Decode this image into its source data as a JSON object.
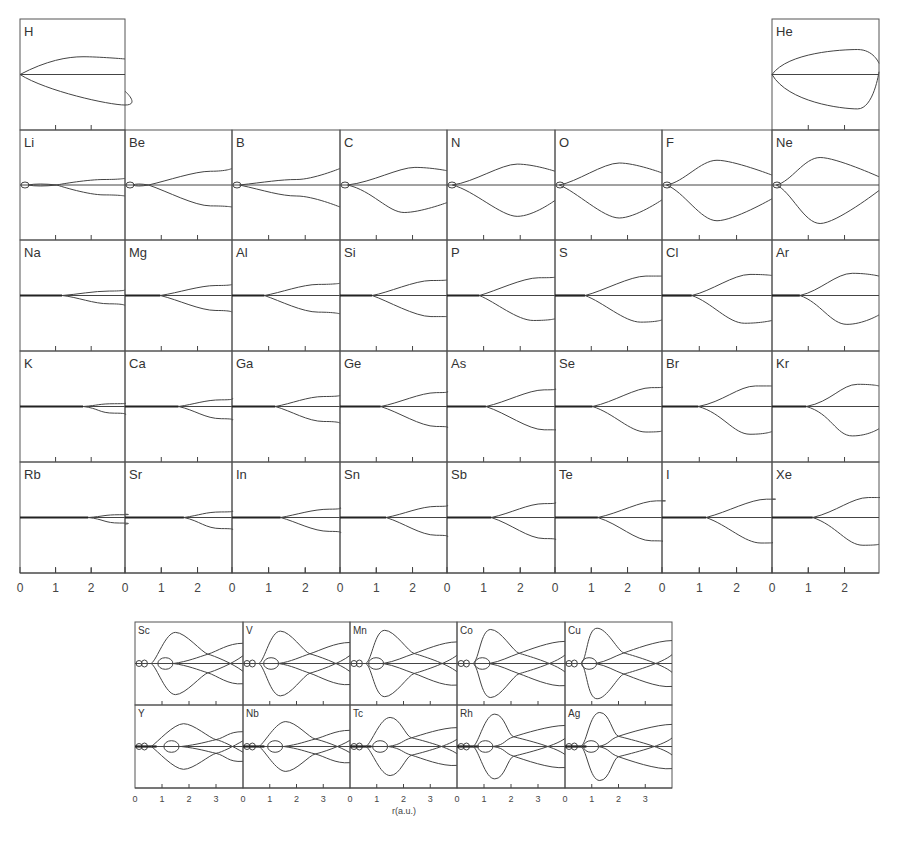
{
  "figure": {
    "x_axis_label": "r(a.u.)",
    "main_ticks": [
      "0",
      "1",
      "2"
    ],
    "tm_ticks": [
      "0",
      "1",
      "2",
      "3"
    ]
  },
  "chart_data": [
    {
      "type": "line",
      "title": "Main-group elements: radial curves vs r",
      "xlabel": "r (a.u.)",
      "xlim": [
        0,
        3
      ],
      "x_ticks": [
        0,
        1,
        2
      ],
      "panels": [
        {
          "el": "H",
          "row": 0,
          "col": 0,
          "branch": 0.0,
          "up": [
            0.25,
            -0.25,
            0.6,
            -0.32,
            1.0,
            -0.28
          ],
          "dn": [
            0.25,
            0.3,
            1.0,
            0.55,
            1.0,
            0.3
          ],
          "core": 0
        },
        {
          "el": "He",
          "row": 0,
          "col": 7,
          "branch": 0.0,
          "up": [
            0.15,
            -0.4,
            0.8,
            -0.45,
            1.0,
            -0.2
          ],
          "dn": [
            0.15,
            0.5,
            0.8,
            0.62,
            1.0,
            -0.05
          ],
          "core": 0
        },
        {
          "el": "Li",
          "row": 1,
          "col": 0,
          "branch": 0.35,
          "up": [
            0.4,
            -0.02,
            0.8,
            -0.1,
            1.0,
            -0.12
          ],
          "dn": [
            0.4,
            0.03,
            0.8,
            0.18,
            1.0,
            0.2
          ],
          "core": 1
        },
        {
          "el": "Be",
          "row": 1,
          "col": 1,
          "branch": 0.22,
          "up": [
            0.4,
            -0.08,
            0.8,
            -0.25,
            1.0,
            -0.3
          ],
          "dn": [
            0.4,
            0.12,
            0.8,
            0.38,
            1.0,
            0.4
          ],
          "core": 1
        },
        {
          "el": "B",
          "row": 1,
          "col": 2,
          "branch": 0.07,
          "up": [
            0.3,
            -0.05,
            0.6,
            -0.1,
            1.0,
            -0.3
          ],
          "dn": [
            0.3,
            0.1,
            0.6,
            0.2,
            1.0,
            0.4
          ],
          "core": 1
        },
        {
          "el": "C",
          "row": 1,
          "col": 3,
          "branch": 0.07,
          "up": [
            0.3,
            -0.05,
            0.7,
            -0.32,
            1.0,
            -0.26
          ],
          "dn": [
            0.3,
            0.1,
            0.6,
            0.5,
            1.0,
            0.32
          ],
          "core": 1
        },
        {
          "el": "N",
          "row": 1,
          "col": 4,
          "branch": 0.05,
          "up": [
            0.25,
            -0.05,
            0.65,
            -0.38,
            1.0,
            -0.25
          ],
          "dn": [
            0.25,
            0.1,
            0.65,
            0.57,
            1.0,
            0.28
          ],
          "core": 1
        },
        {
          "el": "O",
          "row": 1,
          "col": 5,
          "branch": 0.04,
          "up": [
            0.2,
            -0.05,
            0.6,
            -0.4,
            1.0,
            -0.22
          ],
          "dn": [
            0.2,
            0.12,
            0.6,
            0.6,
            1.0,
            0.27
          ],
          "core": 1
        },
        {
          "el": "F",
          "row": 1,
          "col": 6,
          "branch": 0.04,
          "up": [
            0.2,
            -0.05,
            0.5,
            -0.45,
            1.0,
            -0.18
          ],
          "dn": [
            0.2,
            0.12,
            0.5,
            0.65,
            1.0,
            0.25
          ],
          "core": 1
        },
        {
          "el": "Ne",
          "row": 1,
          "col": 7,
          "branch": 0.04,
          "up": [
            0.18,
            -0.06,
            0.45,
            -0.5,
            1.0,
            -0.15
          ],
          "dn": [
            0.18,
            0.12,
            0.45,
            0.7,
            1.0,
            0.1
          ],
          "core": 1
        },
        {
          "el": "Na",
          "row": 2,
          "col": 0,
          "branch": 0.4,
          "up": [
            0.55,
            -0.02,
            0.85,
            -0.08,
            1.0,
            -0.1
          ],
          "dn": [
            0.55,
            0.03,
            0.85,
            0.15,
            1.0,
            0.18
          ],
          "core": 2
        },
        {
          "el": "Mg",
          "row": 2,
          "col": 1,
          "branch": 0.33,
          "up": [
            0.5,
            -0.05,
            0.85,
            -0.18,
            1.0,
            -0.2
          ],
          "dn": [
            0.5,
            0.08,
            0.85,
            0.27,
            1.0,
            0.3
          ],
          "core": 2
        },
        {
          "el": "Al",
          "row": 2,
          "col": 2,
          "branch": 0.3,
          "up": [
            0.45,
            -0.05,
            0.8,
            -0.2,
            1.0,
            -0.22
          ],
          "dn": [
            0.45,
            0.1,
            0.8,
            0.3,
            1.0,
            0.33
          ],
          "core": 2
        },
        {
          "el": "Si",
          "row": 2,
          "col": 3,
          "branch": 0.3,
          "up": [
            0.45,
            -0.05,
            0.85,
            -0.27,
            1.0,
            -0.28
          ],
          "dn": [
            0.45,
            0.1,
            0.85,
            0.38,
            1.0,
            0.38
          ],
          "core": 2
        },
        {
          "el": "P",
          "row": 2,
          "col": 4,
          "branch": 0.3,
          "up": [
            0.45,
            -0.08,
            0.85,
            -0.32,
            1.0,
            -0.33
          ],
          "dn": [
            0.45,
            0.12,
            0.8,
            0.45,
            1.0,
            0.42
          ],
          "core": 2
        },
        {
          "el": "S",
          "row": 2,
          "col": 5,
          "branch": 0.28,
          "up": [
            0.45,
            -0.08,
            0.85,
            -0.35,
            1.0,
            -0.35
          ],
          "dn": [
            0.45,
            0.12,
            0.8,
            0.48,
            1.0,
            0.44
          ],
          "core": 2
        },
        {
          "el": "Cl",
          "row": 2,
          "col": 6,
          "branch": 0.27,
          "up": [
            0.45,
            -0.08,
            0.8,
            -0.38,
            1.0,
            -0.36
          ],
          "dn": [
            0.45,
            0.12,
            0.75,
            0.5,
            1.0,
            0.45
          ],
          "core": 2
        },
        {
          "el": "Ar",
          "row": 2,
          "col": 7,
          "branch": 0.26,
          "up": [
            0.45,
            -0.08,
            0.75,
            -0.4,
            1.0,
            -0.35
          ],
          "dn": [
            0.45,
            0.12,
            0.7,
            0.52,
            1.0,
            0.35
          ],
          "core": 2
        },
        {
          "el": "K",
          "row": 3,
          "col": 0,
          "branch": 0.6,
          "up": [
            0.75,
            -0.02,
            0.9,
            -0.05,
            1.0,
            -0.06
          ],
          "dn": [
            0.75,
            0.03,
            0.9,
            0.12,
            1.0,
            0.15
          ],
          "core": 3
        },
        {
          "el": "Ca",
          "row": 3,
          "col": 1,
          "branch": 0.5,
          "up": [
            0.65,
            -0.04,
            0.9,
            -0.12,
            1.0,
            -0.15
          ],
          "dn": [
            0.65,
            0.06,
            0.9,
            0.22,
            1.0,
            0.25
          ],
          "core": 3
        },
        {
          "el": "Ga",
          "row": 3,
          "col": 2,
          "branch": 0.4,
          "up": [
            0.55,
            -0.05,
            0.85,
            -0.18,
            1.0,
            -0.2
          ],
          "dn": [
            0.55,
            0.08,
            0.85,
            0.27,
            1.0,
            0.3
          ],
          "core": 3
        },
        {
          "el": "Ge",
          "row": 3,
          "col": 3,
          "branch": 0.38,
          "up": [
            0.55,
            -0.06,
            0.9,
            -0.25,
            1.0,
            -0.27
          ],
          "dn": [
            0.55,
            0.1,
            0.9,
            0.36,
            1.0,
            0.38
          ],
          "core": 3
        },
        {
          "el": "As",
          "row": 3,
          "col": 4,
          "branch": 0.36,
          "up": [
            0.55,
            -0.08,
            0.9,
            -0.3,
            1.0,
            -0.32
          ],
          "dn": [
            0.55,
            0.12,
            0.9,
            0.42,
            1.0,
            0.42
          ],
          "core": 3
        },
        {
          "el": "Se",
          "row": 3,
          "col": 5,
          "branch": 0.35,
          "up": [
            0.55,
            -0.08,
            0.9,
            -0.34,
            1.0,
            -0.35
          ],
          "dn": [
            0.55,
            0.12,
            0.85,
            0.46,
            1.0,
            0.44
          ],
          "core": 3
        },
        {
          "el": "Br",
          "row": 3,
          "col": 6,
          "branch": 0.33,
          "up": [
            0.55,
            -0.08,
            0.85,
            -0.37,
            1.0,
            -0.37
          ],
          "dn": [
            0.55,
            0.12,
            0.8,
            0.5,
            1.0,
            0.45
          ],
          "core": 3
        },
        {
          "el": "Kr",
          "row": 3,
          "col": 7,
          "branch": 0.32,
          "up": [
            0.55,
            -0.08,
            0.8,
            -0.4,
            1.0,
            -0.37
          ],
          "dn": [
            0.55,
            0.12,
            0.75,
            0.53,
            1.0,
            0.4
          ],
          "core": 3
        },
        {
          "el": "Rb",
          "row": 4,
          "col": 0,
          "branch": 0.65,
          "up": [
            0.8,
            -0.02,
            0.95,
            -0.05,
            1.0,
            -0.06
          ],
          "dn": [
            0.8,
            0.03,
            0.95,
            0.1,
            1.0,
            0.12
          ],
          "core": 4
        },
        {
          "el": "Sr",
          "row": 4,
          "col": 1,
          "branch": 0.55,
          "up": [
            0.7,
            -0.04,
            0.9,
            -0.1,
            1.0,
            -0.12
          ],
          "dn": [
            0.7,
            0.06,
            0.9,
            0.2,
            1.0,
            0.22
          ],
          "core": 4
        },
        {
          "el": "In",
          "row": 4,
          "col": 2,
          "branch": 0.45,
          "up": [
            0.6,
            -0.05,
            0.9,
            -0.15,
            1.0,
            -0.18
          ],
          "dn": [
            0.6,
            0.08,
            0.9,
            0.25,
            1.0,
            0.28
          ],
          "core": 4
        },
        {
          "el": "Sn",
          "row": 4,
          "col": 3,
          "branch": 0.43,
          "up": [
            0.6,
            -0.06,
            0.9,
            -0.2,
            1.0,
            -0.22
          ],
          "dn": [
            0.6,
            0.1,
            0.9,
            0.32,
            1.0,
            0.35
          ],
          "core": 4
        },
        {
          "el": "Sb",
          "row": 4,
          "col": 4,
          "branch": 0.41,
          "up": [
            0.6,
            -0.08,
            0.9,
            -0.25,
            1.0,
            -0.27
          ],
          "dn": [
            0.6,
            0.12,
            0.9,
            0.38,
            1.0,
            0.4
          ],
          "core": 4
        },
        {
          "el": "Te",
          "row": 4,
          "col": 5,
          "branch": 0.4,
          "up": [
            0.6,
            -0.08,
            0.95,
            -0.3,
            1.0,
            -0.3
          ],
          "dn": [
            0.6,
            0.12,
            0.9,
            0.42,
            1.0,
            0.43
          ],
          "core": 4
        },
        {
          "el": "I",
          "row": 4,
          "col": 6,
          "branch": 0.4,
          "up": [
            0.6,
            -0.1,
            0.95,
            -0.33,
            1.0,
            -0.33
          ],
          "dn": [
            0.6,
            0.14,
            0.9,
            0.46,
            1.0,
            0.45
          ],
          "core": 4
        },
        {
          "el": "Xe",
          "row": 4,
          "col": 7,
          "branch": 0.38,
          "up": [
            0.6,
            -0.1,
            0.9,
            -0.36,
            1.0,
            -0.36
          ],
          "dn": [
            0.6,
            0.14,
            0.85,
            0.5,
            1.0,
            0.48
          ],
          "core": 4
        }
      ]
    },
    {
      "type": "line",
      "title": "Transition-metal elements: radial curves vs r",
      "xlabel": "r(a.u.)",
      "xlim": [
        0,
        4
      ],
      "x_ticks": [
        0,
        1,
        2,
        3
      ],
      "panels": [
        {
          "el": "Sc",
          "row": 0,
          "col": 0,
          "pk": 1.5,
          "cross": 2.7,
          "amp": 0.75
        },
        {
          "el": "V",
          "row": 0,
          "col": 1,
          "pk": 1.4,
          "cross": 2.5,
          "amp": 0.78
        },
        {
          "el": "Mn",
          "row": 0,
          "col": 2,
          "pk": 1.3,
          "cross": 2.4,
          "amp": 0.8
        },
        {
          "el": "Co",
          "row": 0,
          "col": 3,
          "pk": 1.25,
          "cross": 2.3,
          "amp": 0.82
        },
        {
          "el": "Cu",
          "row": 0,
          "col": 4,
          "pk": 1.2,
          "cross": 2.2,
          "amp": 0.85
        },
        {
          "el": "Y",
          "row": 1,
          "col": 0,
          "pk": 1.8,
          "cross": 3.0,
          "amp": 0.55
        },
        {
          "el": "Nb",
          "row": 1,
          "col": 1,
          "pk": 1.6,
          "cross": 2.7,
          "amp": 0.6
        },
        {
          "el": "Tc",
          "row": 1,
          "col": 2,
          "pk": 1.5,
          "cross": 2.3,
          "amp": 0.7
        },
        {
          "el": "Rh",
          "row": 1,
          "col": 3,
          "pk": 1.4,
          "cross": 2.1,
          "amp": 0.78
        },
        {
          "el": "Ag",
          "row": 1,
          "col": 4,
          "pk": 1.3,
          "cross": 2.0,
          "amp": 0.82
        }
      ]
    }
  ]
}
